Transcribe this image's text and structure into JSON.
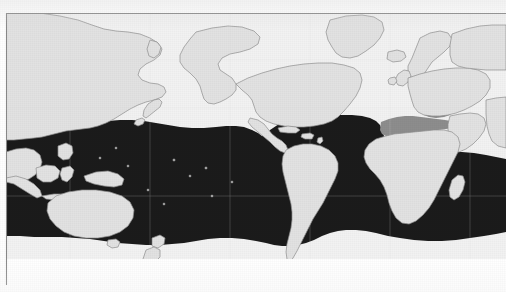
{
  "figure": {
    "kind": "distribution-map",
    "projection": "pacific-centred-world-map",
    "caption": "",
    "title": "",
    "frame": {
      "present": true,
      "sides": "top-and-left",
      "color": "#8a8a8a",
      "top_y": 13,
      "left_x": 6,
      "bottom_y": 285
    },
    "palette": {
      "land": "#e2e2e2",
      "land_outline": "#8f8f8f",
      "ocean_background": "#f2f2f2",
      "range_primary": "#1b1b1b",
      "range_secondary": "#8d8d8d",
      "page": "#ffffff",
      "frame_line": "#8a8a8a"
    },
    "legend_visible": false,
    "axis_labels_visible": false,
    "gridlines_visible": false,
    "scale_bar_visible": false,
    "text_labels": [],
    "shaded_regions": [
      {
        "name": "primary-range",
        "tone": "black",
        "color": "#1b1b1b",
        "description": "Continuous tropical and subtropical belt spanning the Indo-Pacific, Pacific, Atlantic and Indian Oceans"
      },
      {
        "name": "secondary-range",
        "tone": "grey",
        "color": "#8d8d8d",
        "description": "Mediterranean Sea and Black Sea"
      }
    ],
    "landmasses": [
      "North America",
      "South America",
      "Greenland",
      "Iceland",
      "Europe",
      "Africa",
      "Madagascar",
      "Asia",
      "Arabian Peninsula",
      "India",
      "Japan",
      "Southeast Asia",
      "Indonesia",
      "New Guinea",
      "Australia",
      "New Zealand",
      "Caribbean Islands",
      "British Isles"
    ]
  }
}
